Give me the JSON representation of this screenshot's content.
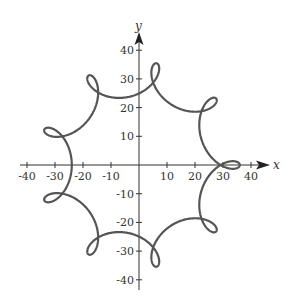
{
  "chart_data": {
    "type": "line",
    "title": "",
    "xlabel": "x",
    "ylabel": "y",
    "xlim": [
      -44,
      44
    ],
    "ylim": [
      -44,
      44
    ],
    "grid": false,
    "legend": null,
    "x_ticks": [
      -40,
      -30,
      -20,
      -10,
      10,
      20,
      30,
      40
    ],
    "y_ticks": [
      -40,
      -30,
      -20,
      -10,
      10,
      20,
      30,
      40
    ],
    "x_tick_labels": [
      "-40",
      "-30",
      "-20",
      "-10",
      "10",
      "20",
      "30",
      "40"
    ],
    "y_tick_labels": [
      "-40",
      "-30",
      "-20",
      "-10",
      "10",
      "20",
      "30",
      "40"
    ],
    "series": [
      {
        "name": "parametric curve",
        "kind": "parametric",
        "description": "Closed curve with 9 small loops, symmetric about the x-axis; outer radius about 36, loops reach inward to radius about 24",
        "equation": "x = 30cos(t) + 6cos(8t), y = 30sin(t) - 6sin(8t), 0 <= t <= 2pi",
        "a": 30,
        "b": 6,
        "n": 8,
        "color": "#555555",
        "loop_points": [
          [
            -27,
            0
          ],
          [
            -22,
            18
          ],
          [
            -5,
            27
          ],
          [
            14,
            24
          ],
          [
            26,
            10
          ],
          [
            26,
            -10
          ],
          [
            14,
            -24
          ],
          [
            -5,
            -27
          ],
          [
            -22,
            -18
          ]
        ],
        "outer_extremes": {
          "right_x_intercept": 36,
          "top_y_max": 35,
          "bottom_y_min": -35
        }
      }
    ]
  },
  "style": {
    "axis_color": "#333333",
    "curve_color": "#555555"
  }
}
